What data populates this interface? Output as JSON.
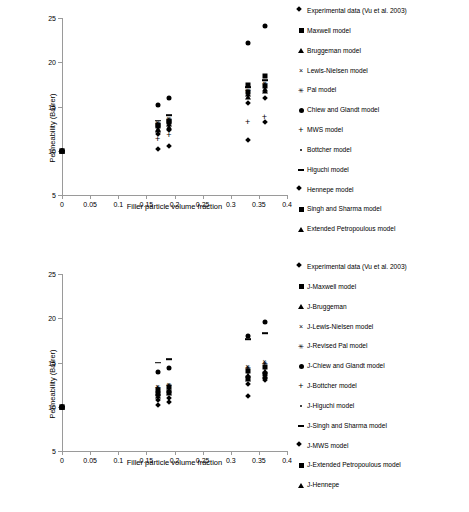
{
  "chart_data": [
    {
      "type": "scatter",
      "id": "top",
      "title": "",
      "xlabel": "Filler particle volume fraction",
      "ylabel": "Permeability (Barrer)",
      "xlim": [
        0,
        0.4
      ],
      "ylim": [
        5,
        25
      ],
      "xticks": [
        "0",
        "0.05",
        "0.1",
        "0.15",
        "0.2",
        "0.25",
        "0.3",
        "0.35",
        "0.4"
      ],
      "xtick_values": [
        0,
        0.05,
        0.1,
        0.15,
        0.2,
        0.25,
        0.3,
        0.35,
        0.4
      ],
      "yticks": [
        "5",
        "10",
        "15",
        "20",
        "25"
      ],
      "ytick_values": [
        5,
        10,
        15,
        20,
        25
      ],
      "grid": false,
      "legend_position": "right",
      "series": [
        {
          "name": "Experimental data (Vu et al. 2003)",
          "marker": "diamond",
          "points": [
            [
              0,
              10.0
            ],
            [
              0.17,
              10.2
            ],
            [
              0.19,
              10.5
            ],
            [
              0.33,
              11.2
            ],
            [
              0.36,
              13.3
            ]
          ]
        },
        {
          "name": "Maxwell model",
          "marker": "square",
          "points": [
            [
              0,
              10.0
            ],
            [
              0.17,
              12.9
            ],
            [
              0.19,
              13.4
            ],
            [
              0.33,
              17.4
            ],
            [
              0.36,
              18.4
            ]
          ]
        },
        {
          "name": "Bruggeman model",
          "marker": "triangle",
          "points": [
            [
              0,
              10.0
            ],
            [
              0.17,
              12.5
            ],
            [
              0.19,
              13.0
            ],
            [
              0.33,
              16.4
            ],
            [
              0.36,
              17.0
            ]
          ]
        },
        {
          "name": "Lewis-Nielsen model",
          "marker": "x",
          "points": [
            [
              0,
              10.0
            ],
            [
              0.17,
              13.2
            ],
            [
              0.19,
              13.7
            ],
            [
              0.33,
              16.8
            ],
            [
              0.36,
              17.6
            ]
          ]
        },
        {
          "name": "Pal model",
          "marker": "star",
          "points": [
            [
              0,
              10.0
            ],
            [
              0.17,
              13.1
            ],
            [
              0.19,
              13.6
            ],
            [
              0.33,
              16.9
            ],
            [
              0.36,
              17.7
            ]
          ]
        },
        {
          "name": "Chiew and Glandt model",
          "marker": "circle",
          "points": [
            [
              0,
              10.0
            ],
            [
              0.17,
              15.2
            ],
            [
              0.19,
              16.0
            ],
            [
              0.33,
              22.2
            ],
            [
              0.36,
              24.1
            ]
          ]
        },
        {
          "name": "MWS model",
          "marker": "plus",
          "points": [
            [
              0,
              10.0
            ],
            [
              0.17,
              11.3
            ],
            [
              0.19,
              11.8
            ],
            [
              0.33,
              13.2
            ],
            [
              0.36,
              13.8
            ]
          ]
        },
        {
          "name": "Bottcher model",
          "marker": "dot",
          "points": [
            [
              0,
              10.0
            ],
            [
              0.17,
              12.6
            ],
            [
              0.19,
              13.1
            ],
            [
              0.33,
              16.3
            ],
            [
              0.36,
              17.0
            ]
          ]
        },
        {
          "name": "Higuchi model",
          "marker": "dash",
          "points": [
            [
              0,
              10.0
            ],
            [
              0.17,
              13.4
            ],
            [
              0.19,
              14.0
            ],
            [
              0.33,
              17.2
            ],
            [
              0.36,
              18.0
            ]
          ]
        },
        {
          "name": "Hennepe model",
          "marker": "diamond",
          "points": [
            [
              0,
              10.0
            ],
            [
              0.17,
              11.9
            ],
            [
              0.19,
              12.4
            ],
            [
              0.33,
              15.4
            ],
            [
              0.36,
              16.0
            ]
          ]
        },
        {
          "name": "Singh and Sharma model",
          "marker": "square",
          "points": [
            [
              0,
              10.0
            ],
            [
              0.17,
              12.8
            ],
            [
              0.19,
              13.3
            ],
            [
              0.33,
              16.6
            ],
            [
              0.36,
              17.3
            ]
          ]
        },
        {
          "name": "Extended Petropoulous model",
          "marker": "triangle",
          "points": [
            [
              0,
              10.0
            ],
            [
              0.17,
              12.3
            ],
            [
              0.19,
              12.7
            ],
            [
              0.33,
              16.1
            ],
            [
              0.36,
              16.7
            ]
          ]
        }
      ]
    },
    {
      "type": "scatter",
      "id": "bottom",
      "title": "",
      "xlabel": "Filler particle volume fraction",
      "ylabel": "Permeability (Barrer)",
      "xlim": [
        0,
        0.4
      ],
      "ylim": [
        5,
        25
      ],
      "xticks": [
        "0",
        "0.05",
        "0.1",
        "0.15",
        "0.2",
        "0.25",
        "0.3",
        "0.35",
        "0.4"
      ],
      "xtick_values": [
        0,
        0.05,
        0.1,
        0.15,
        0.2,
        0.25,
        0.3,
        0.35,
        0.4
      ],
      "yticks": [
        "5",
        "10",
        "15",
        "20",
        "25"
      ],
      "ytick_values": [
        5,
        10,
        15,
        20,
        25
      ],
      "grid": false,
      "legend_position": "right",
      "series": [
        {
          "name": "Experimental data (Vu et al. 2003)",
          "marker": "diamond",
          "points": [
            [
              0,
              10.0
            ],
            [
              0.17,
              10.2
            ],
            [
              0.19,
              10.5
            ],
            [
              0.33,
              11.2
            ],
            [
              0.36,
              13.3
            ]
          ]
        },
        {
          "name": "J-Maxwell model",
          "marker": "square",
          "points": [
            [
              0,
              10.0
            ],
            [
              0.17,
              11.9
            ],
            [
              0.19,
              12.2
            ],
            [
              0.33,
              14.0
            ],
            [
              0.36,
              14.5
            ]
          ]
        },
        {
          "name": "J-Bruggeman",
          "marker": "triangle",
          "points": [
            [
              0,
              10.0
            ],
            [
              0.17,
              11.6
            ],
            [
              0.19,
              11.9
            ],
            [
              0.33,
              13.6
            ],
            [
              0.36,
              14.0
            ]
          ]
        },
        {
          "name": "J-Lewis-Nielsen model",
          "marker": "x",
          "points": [
            [
              0,
              10.0
            ],
            [
              0.17,
              12.3
            ],
            [
              0.19,
              12.6
            ],
            [
              0.33,
              14.6
            ],
            [
              0.36,
              15.2
            ]
          ]
        },
        {
          "name": "J-Revised Pal model",
          "marker": "star",
          "points": [
            [
              0,
              10.0
            ],
            [
              0.17,
              12.2
            ],
            [
              0.19,
              12.5
            ],
            [
              0.33,
              14.5
            ],
            [
              0.36,
              15.0
            ]
          ]
        },
        {
          "name": "J-Chiew and Glandt model",
          "marker": "circle",
          "points": [
            [
              0,
              10.0
            ],
            [
              0.17,
              13.9
            ],
            [
              0.19,
              14.4
            ],
            [
              0.33,
              18.0
            ],
            [
              0.36,
              19.6
            ]
          ]
        },
        {
          "name": "J-Bottcher model",
          "marker": "plus",
          "points": [
            [
              0,
              10.0
            ],
            [
              0.17,
              12.1
            ],
            [
              0.19,
              12.4
            ],
            [
              0.33,
              14.3
            ],
            [
              0.36,
              14.8
            ]
          ]
        },
        {
          "name": "J-Higuchi model",
          "marker": "dot",
          "points": [
            [
              0,
              10.0
            ],
            [
              0.17,
              12.0
            ],
            [
              0.19,
              12.3
            ],
            [
              0.33,
              14.2
            ],
            [
              0.36,
              14.6
            ]
          ]
        },
        {
          "name": "J-Singh and Sharma model",
          "marker": "dash",
          "points": [
            [
              0,
              10.0
            ],
            [
              0.17,
              15.0
            ],
            [
              0.19,
              15.4
            ],
            [
              0.33,
              17.6
            ],
            [
              0.36,
              18.3
            ]
          ]
        },
        {
          "name": "J-MWS model",
          "marker": "diamond",
          "points": [
            [
              0,
              10.0
            ],
            [
              0.17,
              10.8
            ],
            [
              0.19,
              11.0
            ],
            [
              0.33,
              12.6
            ],
            [
              0.36,
              13.0
            ]
          ]
        },
        {
          "name": "J-Extended Petropoulous model",
          "marker": "square",
          "points": [
            [
              0,
              10.0
            ],
            [
              0.17,
              11.4
            ],
            [
              0.19,
              11.7
            ],
            [
              0.33,
              13.3
            ],
            [
              0.36,
              13.7
            ]
          ]
        },
        {
          "name": "J-Hennepe",
          "marker": "triangle",
          "points": [
            [
              0,
              10.0
            ],
            [
              0.17,
              11.2
            ],
            [
              0.19,
              11.5
            ],
            [
              0.33,
              13.1
            ],
            [
              0.36,
              13.5
            ]
          ]
        }
      ]
    }
  ]
}
